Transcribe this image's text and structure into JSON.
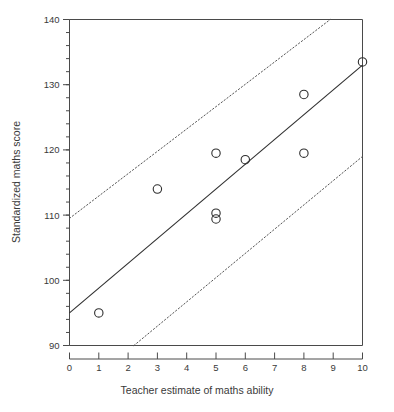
{
  "chart_data": {
    "type": "scatter",
    "title": "",
    "xlabel": "Teacher estimate of maths ability",
    "ylabel": "Standardized maths score",
    "xlim": [
      0,
      10
    ],
    "ylim": [
      90,
      140
    ],
    "grid": false,
    "legend": null,
    "x_ticks": [
      0,
      1,
      2,
      3,
      4,
      5,
      6,
      7,
      8,
      9,
      10
    ],
    "x_tick_labels": [
      "0",
      "1",
      "2",
      "3",
      "4",
      "5",
      "6",
      "7",
      "8",
      "9",
      "10"
    ],
    "y_ticks": [
      90,
      100,
      110,
      120,
      130,
      140
    ],
    "y_tick_labels": [
      "90",
      "100",
      "110",
      "120",
      "130",
      "140"
    ],
    "y_minor_tick_step": 2,
    "points": [
      {
        "x": 1,
        "y": 95.0
      },
      {
        "x": 3,
        "y": 114.0
      },
      {
        "x": 5,
        "y": 119.5
      },
      {
        "x": 5,
        "y": 110.3
      },
      {
        "x": 5,
        "y": 109.4
      },
      {
        "x": 6,
        "y": 118.5
      },
      {
        "x": 8,
        "y": 128.5
      },
      {
        "x": 8,
        "y": 119.5
      },
      {
        "x": 10,
        "y": 133.5
      }
    ],
    "marker_style": "open-circle",
    "series": [
      {
        "name": "regression-line",
        "type": "line",
        "style": "solid",
        "x": [
          0,
          10
        ],
        "values": [
          95.0,
          133.0
        ]
      },
      {
        "name": "upper-confidence-band",
        "type": "line",
        "style": "dotted",
        "x": [
          0,
          8.9
        ],
        "values": [
          109.5,
          140.0
        ]
      },
      {
        "name": "lower-confidence-band",
        "type": "line",
        "style": "dotted",
        "x": [
          2.2,
          10
        ],
        "values": [
          90.0,
          119.0
        ]
      }
    ]
  }
}
